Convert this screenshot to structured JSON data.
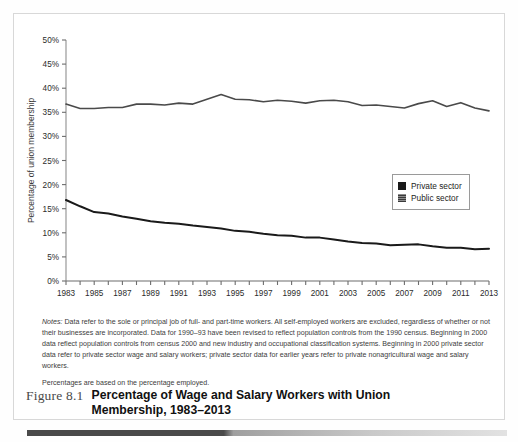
{
  "figure": {
    "number_label": "Figure 8.1",
    "title": "Percentage of Wage and Salary Workers with Union Membership, 1983–2013"
  },
  "notes": {
    "label": "Notes:",
    "paragraph1": "Data refer to the sole or principal job of full- and part-time workers. All self-employed workers are excluded, regardless of whether or not their businesses are incorporated. Data for 1990–93 have been revised to reflect population controls from the 1990 census. Beginning in 2000 data reflect population controls from census 2000 and new industry and occupational classification systems. Beginning in 2000 private sector data refer to private sector wage and salary workers; private sector data for earlier years refer to private nonagricultural wage and salary workers.",
    "paragraph2": "Percentages are based on the percentage employed."
  },
  "legend": {
    "items": [
      {
        "label": "Private sector",
        "swatch": "solid-black"
      },
      {
        "label": "Public sector",
        "swatch": "hatched-gray"
      }
    ]
  },
  "chart_data": {
    "type": "line",
    "title": "Percentage of Wage and Salary Workers with Union Membership, 1983–2013",
    "xlabel": "",
    "ylabel": "Percentage of union membership",
    "xlim": [
      1983,
      2013
    ],
    "ylim": [
      0,
      50
    ],
    "ytick_values": [
      0,
      5,
      10,
      15,
      20,
      25,
      30,
      35,
      40,
      45,
      50
    ],
    "ytick_labels": [
      "0%",
      "5%",
      "10%",
      "15%",
      "20%",
      "25%",
      "30%",
      "35%",
      "40%",
      "45%",
      "50%"
    ],
    "x": [
      1983,
      1984,
      1985,
      1986,
      1987,
      1988,
      1989,
      1990,
      1991,
      1992,
      1993,
      1994,
      1995,
      1996,
      1997,
      1998,
      1999,
      2000,
      2001,
      2002,
      2003,
      2004,
      2005,
      2006,
      2007,
      2008,
      2009,
      2010,
      2011,
      2012,
      2013
    ],
    "xtick_labels": [
      "1983",
      "1985",
      "1987",
      "1989",
      "1991",
      "1993",
      "1995",
      "1997",
      "1999",
      "2001",
      "2003",
      "2005",
      "2007",
      "2009",
      "2011",
      "2013"
    ],
    "xtick_label_step": 2,
    "minor_ticks_every": 1,
    "grid": false,
    "legend_position": "right-middle",
    "series": [
      {
        "name": "Public sector",
        "color": "#4a4a4a",
        "values": [
          36.7,
          35.8,
          35.8,
          36.0,
          36.0,
          36.7,
          36.7,
          36.5,
          36.9,
          36.7,
          37.7,
          38.7,
          37.7,
          37.6,
          37.2,
          37.5,
          37.3,
          36.9,
          37.4,
          37.5,
          37.2,
          36.4,
          36.5,
          36.2,
          35.9,
          36.8,
          37.4,
          36.2,
          37.0,
          35.9,
          35.3
        ]
      },
      {
        "name": "Private sector",
        "color": "#1a1a1a",
        "values": [
          16.8,
          15.5,
          14.3,
          14.0,
          13.4,
          12.9,
          12.4,
          12.1,
          11.9,
          11.5,
          11.2,
          10.9,
          10.4,
          10.2,
          9.8,
          9.5,
          9.4,
          9.0,
          9.0,
          8.6,
          8.2,
          7.9,
          7.8,
          7.4,
          7.5,
          7.6,
          7.2,
          6.9,
          6.9,
          6.6,
          6.7
        ]
      }
    ]
  }
}
